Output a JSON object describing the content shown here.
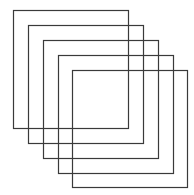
{
  "diagram": {
    "stroke_color": "#3a3a3a",
    "background_color": "#ffffff",
    "squares": [
      {
        "x": 13.5,
        "y": 10.5,
        "width": 115,
        "height": 118
      },
      {
        "x": 28.5,
        "y": 25.5,
        "width": 115,
        "height": 118
      },
      {
        "x": 43.5,
        "y": 40.5,
        "width": 115,
        "height": 118
      },
      {
        "x": 58.5,
        "y": 55.5,
        "width": 115,
        "height": 118
      },
      {
        "x": 72.5,
        "y": 70.5,
        "width": 115,
        "height": 117
      }
    ]
  }
}
